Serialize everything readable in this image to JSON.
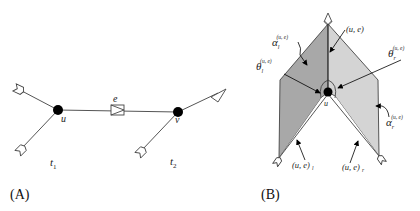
{
  "panel_a": {
    "label": "(A)",
    "node_u": "u",
    "node_v": "v",
    "edge": "e",
    "tree_1": "t",
    "tree_1_sub": "1",
    "tree_2": "t",
    "tree_2_sub": "2"
  },
  "panel_b": {
    "label": "(B)",
    "node_u": "u",
    "spine": "(u, e)",
    "alpha_l": "α",
    "alpha_l_sub": "l",
    "alpha_l_sup": "(u, e)",
    "theta_l": "θ",
    "theta_l_sub": "l",
    "theta_l_sup": "(u, e)",
    "theta_r": "θ",
    "theta_r_sub": "r",
    "theta_r_sup": "(u, e)",
    "alpha_r": "α",
    "alpha_r_sub": "r",
    "alpha_r_sup": "(u, e)",
    "edge_l": "(u, e)",
    "edge_l_sub": "l",
    "edge_r": "(u, e)",
    "edge_r_sub": "r"
  },
  "colors": {
    "left_face": "#a8a8a8",
    "right_face": "#d6d6d6",
    "stroke": "#444444",
    "node": "#000000"
  }
}
